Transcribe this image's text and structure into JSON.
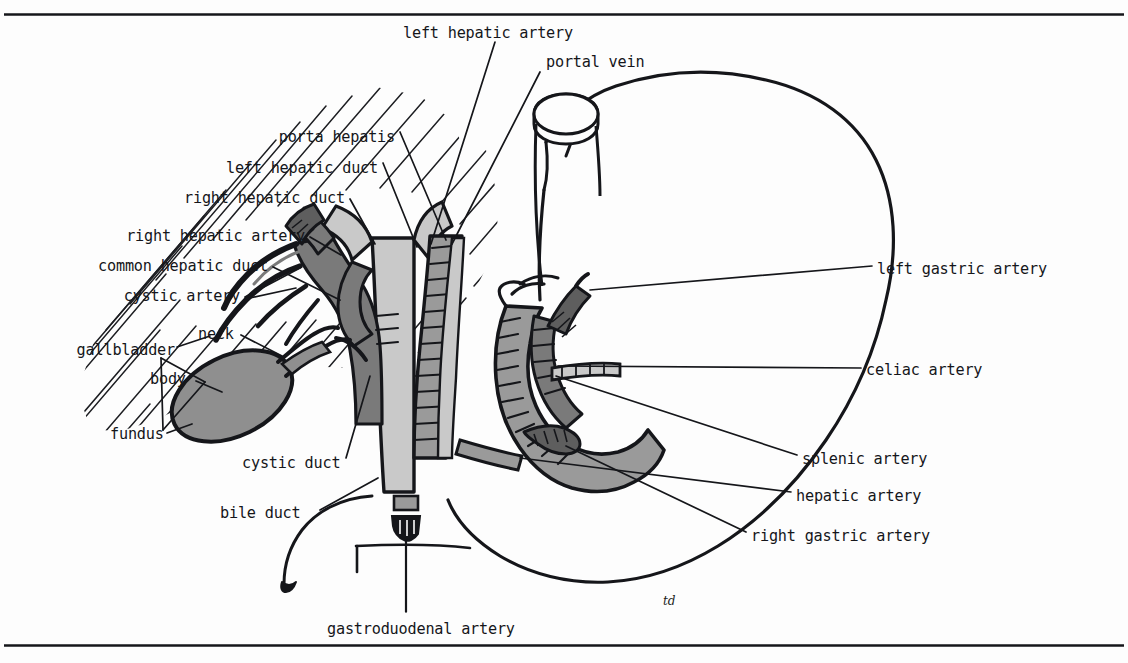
{
  "figure": {
    "kind": "anatomical-line-diagram",
    "signature": "td",
    "rules": {
      "top_y": 14,
      "bottom_y": 645
    },
    "colors": {
      "ink": "#15161a",
      "paper": "#fdfdfd",
      "duct_light_gray": "#c9c9c9",
      "vessel_mid_gray": "#9a9a9a",
      "vessel_dark_gray": "#7a7a7a",
      "gallbladder_gray": "#8f8f8f",
      "hatch": "#1d1e22"
    }
  },
  "labels": {
    "top": [
      {
        "id": "left-hepatic-artery",
        "text": "left hepatic artery",
        "x": 403,
        "y": 33,
        "align": "left"
      },
      {
        "id": "portal-vein",
        "text": "portal vein",
        "x": 546,
        "y": 62,
        "align": "left"
      }
    ],
    "left": [
      {
        "id": "porta-hepatis",
        "text": "porta hepatis",
        "x": 395,
        "y": 137,
        "align": "right"
      },
      {
        "id": "left-hepatic-duct",
        "text": "left hepatic duct",
        "x": 378,
        "y": 168,
        "align": "right"
      },
      {
        "id": "right-hepatic-duct",
        "text": "right hepatic duct",
        "x": 345,
        "y": 198,
        "align": "right"
      },
      {
        "id": "right-hepatic-artery",
        "text": "right hepatic artery",
        "x": 305,
        "y": 236,
        "align": "right"
      },
      {
        "id": "common-hepatic-duct",
        "text": "common hepatic duct",
        "x": 268,
        "y": 266,
        "align": "right"
      },
      {
        "id": "cystic-artery",
        "text": "cystic artery",
        "x": 240,
        "y": 296,
        "align": "right"
      },
      {
        "id": "gallbladder",
        "text": "gallbladder",
        "x": 172,
        "y": 350,
        "align": "right"
      },
      {
        "id": "neck",
        "text": "neck",
        "x": 198,
        "y": 334,
        "align": "left"
      },
      {
        "id": "body",
        "text": "body",
        "x": 150,
        "y": 379,
        "align": "left"
      },
      {
        "id": "fundus",
        "text": "fundus",
        "x": 110,
        "y": 434,
        "align": "left"
      },
      {
        "id": "cystic-duct",
        "text": "cystic duct",
        "x": 242,
        "y": 463,
        "align": "left"
      },
      {
        "id": "bile-duct",
        "text": "bile duct",
        "x": 220,
        "y": 513,
        "align": "left"
      }
    ],
    "right": [
      {
        "id": "left-gastric-artery",
        "text": "left gastric artery",
        "x": 877,
        "y": 269,
        "align": "left"
      },
      {
        "id": "celiac-artery",
        "text": "celiac artery",
        "x": 866,
        "y": 370,
        "align": "left"
      },
      {
        "id": "splenic-artery",
        "text": "splenic artery",
        "x": 802,
        "y": 459,
        "align": "left"
      },
      {
        "id": "hepatic-artery",
        "text": "hepatic artery",
        "x": 796,
        "y": 496,
        "align": "left"
      },
      {
        "id": "right-gastric-artery",
        "text": "right gastric artery",
        "x": 751,
        "y": 536,
        "align": "left"
      }
    ],
    "bottom": [
      {
        "id": "gastroduodenal-artery",
        "text": "gastroduodenal artery",
        "x": 327,
        "y": 629,
        "align": "left"
      }
    ]
  },
  "structures": [
    {
      "id": "liver",
      "name": "liver (hatched field)",
      "fill": "none"
    },
    {
      "id": "stomach",
      "name": "stomach outline",
      "fill": "none"
    },
    {
      "id": "duodenum",
      "name": "duodenum",
      "fill": "#9a9a9a"
    },
    {
      "id": "gallbladder-body",
      "name": "gallbladder",
      "fill": "#8f8f8f"
    },
    {
      "id": "bile-duct-trunk",
      "name": "bile duct",
      "fill": "#c9c9c9"
    },
    {
      "id": "portal-vein-trunk",
      "name": "portal vein",
      "fill": "#9a9a9a"
    },
    {
      "id": "hepatic-artery-trunk",
      "name": "hepatic artery",
      "fill": "#7a7a7a"
    },
    {
      "id": "gastroduodenal-stub",
      "name": "gastroduodenal artery cut stub",
      "fill": "#15161a"
    }
  ]
}
